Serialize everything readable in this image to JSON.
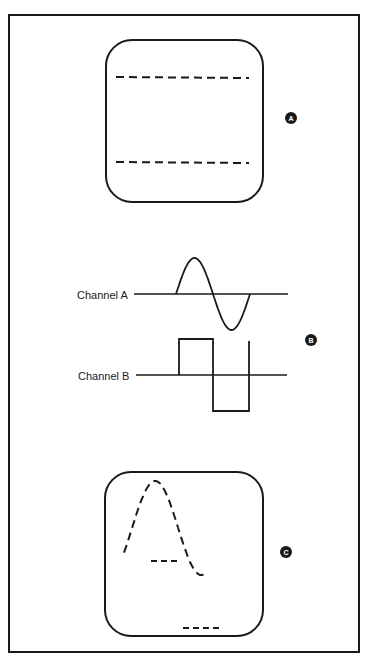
{
  "figure": {
    "panels": [
      {
        "id": "A",
        "badge": "A",
        "content": "screen with two dashed horizontal traces"
      },
      {
        "id": "B",
        "badge": "B",
        "content": "channel waveforms"
      },
      {
        "id": "C",
        "badge": "C",
        "content": "screen with dashed sine trace and two dashed segments"
      }
    ],
    "channels": [
      {
        "label": "Channel A",
        "waveform": "sine"
      },
      {
        "label": "Channel B",
        "waveform": "square"
      }
    ]
  },
  "colors": {
    "ink": "#1a1a1a",
    "background": "#ffffff"
  }
}
